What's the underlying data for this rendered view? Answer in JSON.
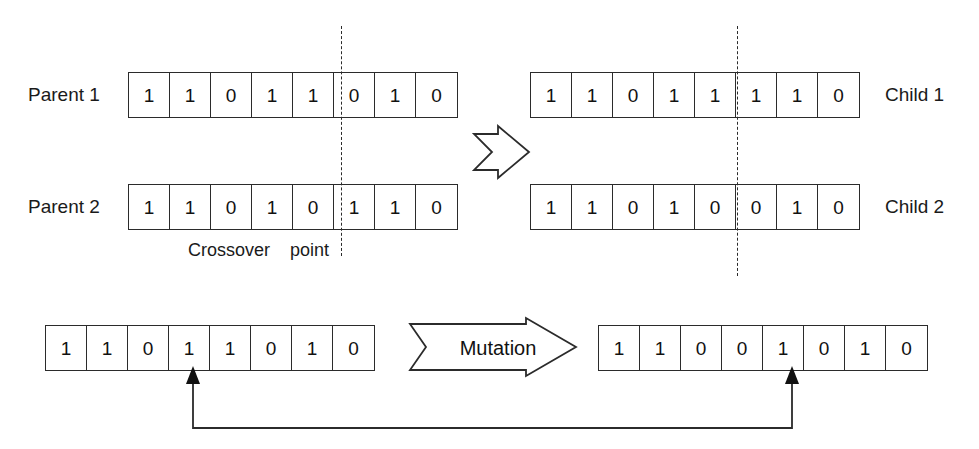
{
  "diagram": {
    "ink_color": "#2b2b2b",
    "background_color": "#ffffff"
  },
  "crossover": {
    "caption_left": "Crossover",
    "caption_right": "point",
    "crossover_point_index": 5,
    "arrow_symbol": "chevron-right-arrow",
    "parents": [
      {
        "label": "Parent 1",
        "bits": [
          "1",
          "1",
          "0",
          "1",
          "1",
          "0",
          "1",
          "0"
        ]
      },
      {
        "label": "Parent 2",
        "bits": [
          "1",
          "1",
          "0",
          "1",
          "0",
          "1",
          "1",
          "0"
        ]
      }
    ],
    "children": [
      {
        "label": "Child 1",
        "bits": [
          "1",
          "1",
          "0",
          "1",
          "1",
          "1",
          "1",
          "0"
        ]
      },
      {
        "label": "Child 2",
        "bits": [
          "1",
          "1",
          "0",
          "1",
          "0",
          "0",
          "1",
          "0"
        ]
      }
    ]
  },
  "mutation": {
    "operator_label": "Mutation",
    "arrow_symbol": "block-right-arrow",
    "mutated_bit_index": 4,
    "before": {
      "bits": [
        "1",
        "1",
        "0",
        "1",
        "1",
        "0",
        "1",
        "0"
      ]
    },
    "after": {
      "bits": [
        "1",
        "1",
        "0",
        "0",
        "1",
        "0",
        "1",
        "0"
      ]
    }
  }
}
